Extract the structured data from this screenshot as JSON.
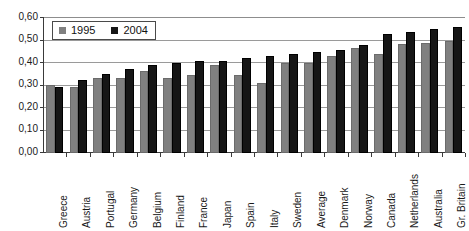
{
  "chart_data": {
    "type": "bar",
    "title": "",
    "subtitle": "",
    "xlabel": "",
    "ylabel": "",
    "ylim": [
      0.0,
      0.6
    ],
    "grid": true,
    "legend_position": "top-left",
    "y_ticks": [
      "0,00",
      "0,10",
      "0,20",
      "0,30",
      "0,40",
      "0,50",
      "0,60"
    ],
    "y_tick_values": [
      0.0,
      0.1,
      0.2,
      0.3,
      0.4,
      0.5,
      0.6
    ],
    "categories": [
      "Greece",
      "Austria",
      "Portugal",
      "Germany",
      "Belgium",
      "Finland",
      "France",
      "Japan",
      "Spain",
      "Italy",
      "Sweden",
      "Average",
      "Denmark",
      "Norway",
      "Canada",
      "Netherlands",
      "Australia",
      "Gr. Britain"
    ],
    "series": [
      {
        "name": "1995",
        "color": "#808080",
        "values": [
          0.3,
          0.29,
          0.33,
          0.33,
          0.36,
          0.33,
          0.345,
          0.39,
          0.345,
          0.31,
          0.395,
          0.395,
          0.43,
          0.465,
          0.435,
          0.48,
          0.485,
          0.495
        ]
      },
      {
        "name": "2004",
        "color": "#161616",
        "values": [
          0.29,
          0.32,
          0.35,
          0.37,
          0.39,
          0.395,
          0.405,
          0.405,
          0.42,
          0.43,
          0.435,
          0.445,
          0.455,
          0.475,
          0.525,
          0.535,
          0.545,
          0.555
        ]
      }
    ]
  },
  "legend": {
    "entries": [
      {
        "label": "1995",
        "swatch": "gray-square-swatch"
      },
      {
        "label": "2004",
        "swatch": "black-square-swatch"
      }
    ]
  }
}
